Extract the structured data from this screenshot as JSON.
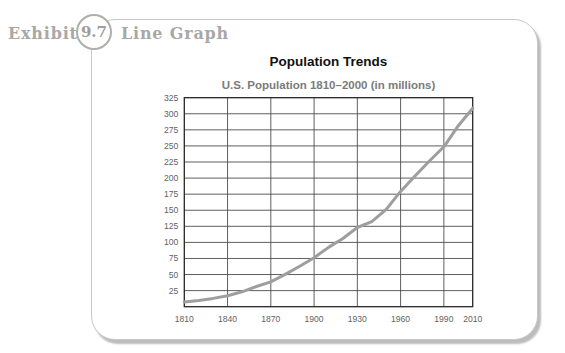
{
  "exhibit": {
    "prefix": "Exhibit",
    "number": "9.7",
    "label": "Line Graph"
  },
  "chart_data": {
    "type": "line",
    "title": "Population Trends",
    "subtitle": "U.S. Population 1810–2000 (in millions)",
    "xlabel": "",
    "ylabel": "",
    "xlim": [
      1810,
      2010
    ],
    "ylim": [
      0,
      325
    ],
    "x_ticks": [
      1810,
      1840,
      1870,
      1900,
      1930,
      1960,
      1990,
      2010
    ],
    "y_ticks": [
      25,
      50,
      75,
      100,
      125,
      150,
      175,
      200,
      225,
      250,
      275,
      300,
      325
    ],
    "grid": true,
    "legend_position": "none",
    "series": [
      {
        "name": "U.S. population (millions)",
        "x": [
          1810,
          1820,
          1830,
          1840,
          1850,
          1860,
          1870,
          1880,
          1890,
          1900,
          1910,
          1920,
          1930,
          1940,
          1950,
          1960,
          1970,
          1980,
          1990,
          2000,
          2010
        ],
        "values": [
          7.2,
          9.6,
          12.9,
          17.1,
          23.2,
          31.4,
          38.6,
          50.2,
          63.0,
          76.2,
          92.2,
          106.0,
          123.2,
          132.2,
          151.3,
          179.3,
          203.3,
          226.5,
          248.7,
          281.4,
          308.7
        ]
      }
    ],
    "colors": {
      "line": "#9e9e9e",
      "grid": "#4d4d4d",
      "plot_border": "#262626",
      "tick_label": "#636363"
    }
  }
}
